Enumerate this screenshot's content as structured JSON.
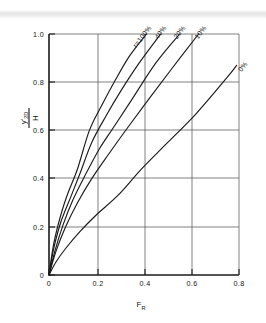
{
  "chart_data": {
    "type": "line",
    "title": "",
    "xlabel": "F_R",
    "ylabel": "y'_2D / H",
    "xlim": [
      0,
      0.8
    ],
    "ylim": [
      0,
      1.0
    ],
    "grid": true,
    "legend_position": "inline-curve-labels",
    "xticks": [
      "0",
      "0.2",
      "0.4",
      "0.6",
      "0.8"
    ],
    "xtick_values": [
      0,
      0.2,
      0.4,
      0.6,
      0.8
    ],
    "yticks": [
      "0",
      "0.2",
      "0.4",
      "0.6",
      "0.8",
      "1.0"
    ],
    "ytick_values": [
      0,
      0.2,
      0.4,
      0.6,
      0.8,
      1.0
    ],
    "series": [
      {
        "name": "r = 100%",
        "label": "r=100%",
        "x": [
          0,
          0.02,
          0.05,
          0.08,
          0.12,
          0.17,
          0.22,
          0.28,
          0.34,
          0.41
        ],
        "y": [
          0,
          0.13,
          0.25,
          0.34,
          0.44,
          0.6,
          0.7,
          0.81,
          0.91,
          1.0
        ]
      },
      {
        "name": "40%",
        "label": "40%",
        "x": [
          0,
          0.02,
          0.05,
          0.09,
          0.13,
          0.18,
          0.24,
          0.3,
          0.38,
          0.47
        ],
        "y": [
          0,
          0.11,
          0.22,
          0.32,
          0.42,
          0.55,
          0.66,
          0.76,
          0.88,
          1.0
        ]
      },
      {
        "name": "20%",
        "label": "20%",
        "x": [
          0,
          0.025,
          0.06,
          0.1,
          0.15,
          0.21,
          0.27,
          0.35,
          0.45,
          0.55
        ],
        "y": [
          0,
          0.1,
          0.21,
          0.31,
          0.41,
          0.52,
          0.61,
          0.73,
          0.88,
          1.0
        ]
      },
      {
        "name": "10%",
        "label": "10%",
        "x": [
          0,
          0.03,
          0.07,
          0.12,
          0.18,
          0.25,
          0.33,
          0.42,
          0.52,
          0.63
        ],
        "y": [
          0,
          0.1,
          0.2,
          0.3,
          0.4,
          0.5,
          0.61,
          0.73,
          0.86,
          1.0
        ]
      },
      {
        "name": "0%",
        "label": "0%",
        "x": [
          0,
          0.03,
          0.07,
          0.13,
          0.2,
          0.29,
          0.39,
          0.5,
          0.62,
          0.75,
          0.79
        ],
        "y": [
          0,
          0.055,
          0.11,
          0.18,
          0.25,
          0.33,
          0.44,
          0.55,
          0.67,
          0.82,
          0.87
        ]
      }
    ],
    "axis_title_y_parts": {
      "numerator_main": "y'",
      "numerator_sub": "2D",
      "denominator": "H"
    },
    "axis_title_x_parts": {
      "main": "F",
      "sub": "R"
    }
  }
}
